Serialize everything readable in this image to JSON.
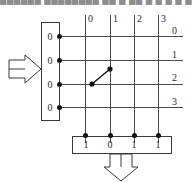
{
  "diagram": {
    "title_band": "██████ ████████  ██ █ ██ █ █ █      █ █",
    "type": "crossbar-switch-grid",
    "input_register": {
      "name": "input-register",
      "values": [
        "0",
        "0",
        "0",
        "0"
      ],
      "arrow": "left-input-arrow"
    },
    "grid": {
      "columns": 4,
      "rows": 4,
      "column_labels": [
        "0",
        "1",
        "2",
        "3"
      ],
      "row_labels": [
        "0",
        "1",
        "2",
        "3"
      ],
      "line_color": "#4a4a4a"
    },
    "crosspoint_connector": {
      "name": "diagonal-switch-connector",
      "from_row_label": "2",
      "to_column_label": "1",
      "style": "diagonal-line-with-endpoint-dots"
    },
    "output_register": {
      "name": "output-register",
      "values": [
        "1",
        "0",
        "1",
        "1"
      ],
      "arrow": "down-output-arrow"
    },
    "node_dots": {
      "input_side_count": 4,
      "output_side_count": 4,
      "color": "#111111"
    }
  }
}
